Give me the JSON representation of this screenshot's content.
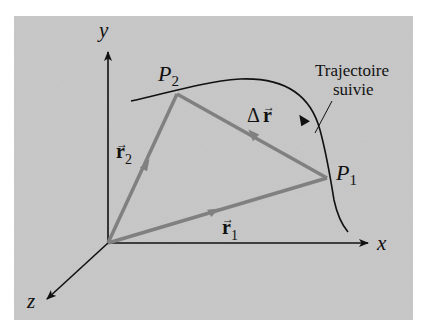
{
  "figure": {
    "axes": {
      "x": "x",
      "y": "y",
      "z": "z"
    },
    "points": {
      "p1": {
        "letter": "P",
        "sub": "1"
      },
      "p2": {
        "letter": "P",
        "sub": "2"
      }
    },
    "vectors": {
      "r1": {
        "letter": "r",
        "sub": "1",
        "arrow": "→"
      },
      "r2": {
        "letter": "r",
        "sub": "2",
        "arrow": "→"
      },
      "dr": {
        "delta": "Δ",
        "letter": "r",
        "arrow": "→"
      }
    },
    "path_label": {
      "line1": "Trajectoire",
      "line2": "suivie"
    },
    "colors": {
      "panel": "#c4c4c4",
      "vector": "#808080",
      "axis": "#111111"
    }
  }
}
